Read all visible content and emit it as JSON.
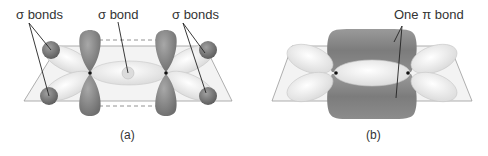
{
  "panel_a": {
    "caption": "(a)",
    "labels": {
      "left": "σ bonds",
      "center": "σ bond",
      "right": "σ bonds"
    }
  },
  "panel_b": {
    "caption": "(b)",
    "labels": {
      "pi": "One π bond"
    }
  },
  "colors": {
    "p_lobe": "#8a8a8a",
    "sp2_lobe": "#ededed",
    "plane": "#f2f2f2",
    "plane_edge": "#9a9a9a",
    "h_atom": "#7a7a7a",
    "text": "#333333"
  }
}
